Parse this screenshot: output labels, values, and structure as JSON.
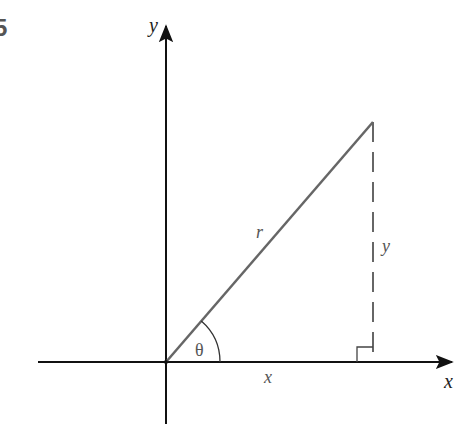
{
  "figure": {
    "number_fragment": "5",
    "labels": {
      "y_axis": "y",
      "x_axis": "x",
      "hypotenuse": "r",
      "vertical_leg": "y",
      "horizontal_leg": "x",
      "angle": "θ"
    },
    "colors": {
      "axes": "#111111",
      "hypotenuse": "#666666",
      "dashed_leg": "#666666",
      "labels": "#555555",
      "right_angle": "#444444"
    },
    "geometry": {
      "origin": [
        166,
        362
      ],
      "apex": [
        373,
        122
      ],
      "foot": [
        373,
        362
      ],
      "x_axis_range": [
        38,
        455
      ],
      "y_axis_range": [
        22,
        424
      ]
    }
  }
}
